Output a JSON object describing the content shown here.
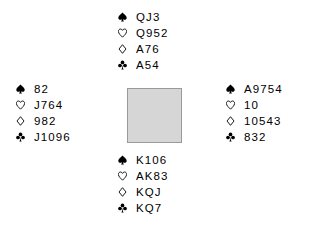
{
  "diagram": {
    "background_color": "#ffffff",
    "text_color": "#000000",
    "center_square": {
      "fill_color": "#d6d6d6",
      "border_color": "#9a9a9a",
      "label": ""
    },
    "suit_symbols": {
      "spade": "♠",
      "heart": "♡",
      "diamond": "♢",
      "club": "♣"
    },
    "hands": {
      "north": {
        "position_label": "North",
        "suits": [
          {
            "suit": "spade",
            "symbol": "♠",
            "cards": "QJ3"
          },
          {
            "suit": "heart",
            "symbol": "♡",
            "cards": "Q952"
          },
          {
            "suit": "diamond",
            "symbol": "♢",
            "cards": "A76"
          },
          {
            "suit": "club",
            "symbol": "♣",
            "cards": "A54"
          }
        ]
      },
      "west": {
        "position_label": "West",
        "suits": [
          {
            "suit": "spade",
            "symbol": "♠",
            "cards": "82"
          },
          {
            "suit": "heart",
            "symbol": "♡",
            "cards": "J764"
          },
          {
            "suit": "diamond",
            "symbol": "♢",
            "cards": "982"
          },
          {
            "suit": "club",
            "symbol": "♣",
            "cards": "J1096"
          }
        ]
      },
      "east": {
        "position_label": "East",
        "suits": [
          {
            "suit": "spade",
            "symbol": "♠",
            "cards": "A9754"
          },
          {
            "suit": "heart",
            "symbol": "♡",
            "cards": "10"
          },
          {
            "suit": "diamond",
            "symbol": "♢",
            "cards": "10543"
          },
          {
            "suit": "club",
            "symbol": "♣",
            "cards": "832"
          }
        ]
      },
      "south": {
        "position_label": "South",
        "suits": [
          {
            "suit": "spade",
            "symbol": "♠",
            "cards": "K106"
          },
          {
            "suit": "heart",
            "symbol": "♡",
            "cards": "AK83"
          },
          {
            "suit": "diamond",
            "symbol": "♢",
            "cards": "KQJ"
          },
          {
            "suit": "club",
            "symbol": "♣",
            "cards": "KQ7"
          }
        ]
      }
    }
  }
}
